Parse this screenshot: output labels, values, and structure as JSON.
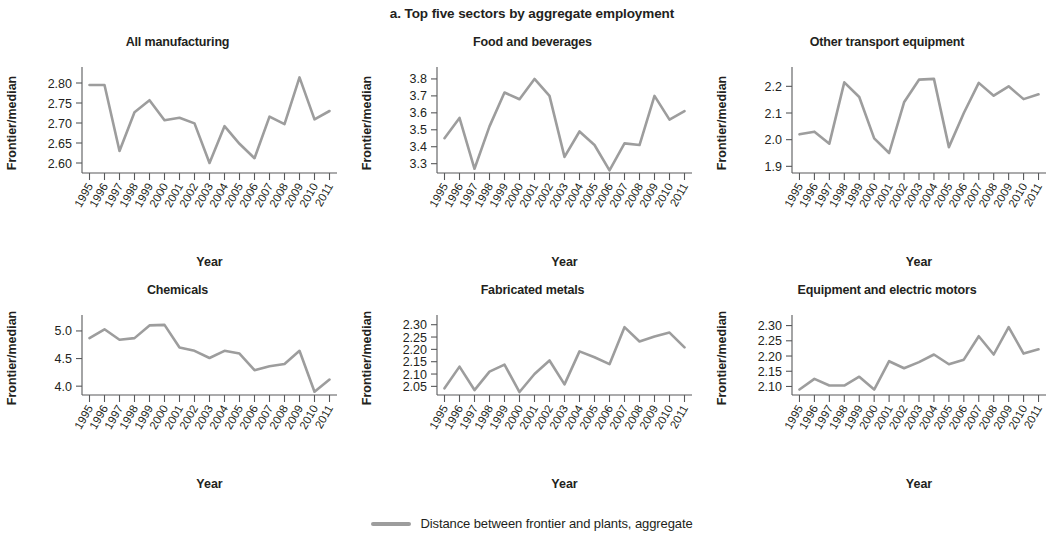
{
  "figure": {
    "title": "a. Top five sectors by aggregate employment",
    "axis_label_y": "Frontier/median",
    "axis_label_x": "Year",
    "legend_label": "Distance between frontier and plants, aggregate",
    "line_color": "#9d9d9d",
    "axis_color": "#58595b"
  },
  "chart_data": [
    {
      "type": "line",
      "title": "All manufacturing",
      "xlabel": "Year",
      "ylabel": "Frontier/median",
      "grid": false,
      "legend_position": "bottom-center",
      "series_name": "Distance between frontier and plants, aggregate",
      "categories": [
        "1995",
        "1996",
        "1997",
        "1998",
        "1999",
        "2000",
        "2001",
        "2002",
        "2003",
        "2004",
        "2005",
        "2006",
        "2007",
        "2008",
        "2009",
        "2010",
        "2011"
      ],
      "x": [
        1995,
        1996,
        1997,
        1998,
        1999,
        2000,
        2001,
        2002,
        2003,
        2004,
        2005,
        2006,
        2007,
        2008,
        2009,
        2010,
        2011
      ],
      "values": [
        2.795,
        2.795,
        2.63,
        2.727,
        2.757,
        2.707,
        2.713,
        2.699,
        2.6,
        2.692,
        2.648,
        2.612,
        2.716,
        2.697,
        2.814,
        2.709,
        2.73
      ],
      "ylim": [
        2.575,
        2.825
      ],
      "yticks": [
        2.6,
        2.65,
        2.7,
        2.75,
        2.8
      ],
      "ytick_labels": [
        "2.60",
        "2.65",
        "2.70",
        "2.75",
        "2.80"
      ]
    },
    {
      "type": "line",
      "title": "Food and beverages",
      "xlabel": "Year",
      "ylabel": "Frontier/median",
      "grid": false,
      "legend_position": "bottom-center",
      "series_name": "Distance between frontier and plants, aggregate",
      "categories": [
        "1995",
        "1996",
        "1997",
        "1998",
        "1999",
        "2000",
        "2001",
        "2002",
        "2003",
        "2004",
        "2005",
        "2006",
        "2007",
        "2008",
        "2009",
        "2010",
        "2011"
      ],
      "x": [
        1995,
        1996,
        1997,
        1998,
        1999,
        2000,
        2001,
        2002,
        2003,
        2004,
        2005,
        2006,
        2007,
        2008,
        2009,
        2010,
        2011
      ],
      "values": [
        3.45,
        3.57,
        3.27,
        3.52,
        3.72,
        3.68,
        3.8,
        3.7,
        3.34,
        3.49,
        3.41,
        3.26,
        3.42,
        3.41,
        3.7,
        3.56,
        3.61
      ],
      "ylim": [
        3.245,
        3.835
      ],
      "yticks": [
        3.3,
        3.4,
        3.5,
        3.6,
        3.7,
        3.8
      ],
      "ytick_labels": [
        "3.3",
        "3.4",
        "3.5",
        "3.6",
        "3.7",
        "3.8"
      ]
    },
    {
      "type": "line",
      "title": "Other transport equipment",
      "xlabel": "Year",
      "ylabel": "Frontier/median",
      "grid": false,
      "legend_position": "bottom-center",
      "series_name": "Distance between frontier and plants, aggregate",
      "categories": [
        "1995",
        "1996",
        "1997",
        "1998",
        "1999",
        "2000",
        "2001",
        "2002",
        "2003",
        "2004",
        "2005",
        "2006",
        "2007",
        "2008",
        "2009",
        "2010",
        "2011"
      ],
      "x": [
        1995,
        1996,
        1997,
        1998,
        1999,
        2000,
        2001,
        2002,
        2003,
        2004,
        2005,
        2006,
        2007,
        2008,
        2009,
        2010,
        2011
      ],
      "values": [
        2.02,
        2.03,
        1.985,
        2.215,
        2.16,
        2.005,
        1.95,
        2.14,
        2.225,
        2.228,
        1.972,
        2.1,
        2.213,
        2.165,
        2.2,
        2.152,
        2.17
      ],
      "ylim": [
        1.875,
        2.25
      ],
      "yticks": [
        1.9,
        2.0,
        2.1,
        2.2
      ],
      "ytick_labels": [
        "1.9",
        "2.0",
        "2.1",
        "2.2"
      ]
    },
    {
      "type": "line",
      "title": "Chemicals",
      "xlabel": "Year",
      "ylabel": "Frontier/median",
      "grid": false,
      "legend_position": "bottom-center",
      "series_name": "Distance between frontier and plants, aggregate",
      "categories": [
        "1995",
        "1996",
        "1997",
        "1998",
        "1999",
        "2000",
        "2001",
        "2002",
        "2003",
        "2004",
        "2005",
        "2006",
        "2007",
        "2008",
        "2009",
        "2010",
        "2011"
      ],
      "x": [
        1995,
        1996,
        1997,
        1998,
        1999,
        2000,
        2001,
        2002,
        2003,
        2004,
        2005,
        2006,
        2007,
        2008,
        2009,
        2010,
        2011
      ],
      "values": [
        4.87,
        5.03,
        4.84,
        4.87,
        5.1,
        5.11,
        4.7,
        4.64,
        4.51,
        4.64,
        4.59,
        4.29,
        4.36,
        4.4,
        4.64,
        3.9,
        4.12
      ],
      "ylim": [
        3.84,
        5.18
      ],
      "yticks": [
        4.0,
        4.5,
        5.0
      ],
      "ytick_labels": [
        "4.0",
        "4.5",
        "5.0"
      ]
    },
    {
      "type": "line",
      "title": "Fabricated metals",
      "xlabel": "Year",
      "ylabel": "Frontier/median",
      "grid": false,
      "legend_position": "bottom-center",
      "series_name": "Distance between frontier and plants, aggregate",
      "categories": [
        "1995",
        "1996",
        "1997",
        "1998",
        "1999",
        "2000",
        "2001",
        "2002",
        "2003",
        "2004",
        "2005",
        "2006",
        "2007",
        "2008",
        "2009",
        "2010",
        "2011"
      ],
      "x": [
        1995,
        1996,
        1997,
        1998,
        1999,
        2000,
        2001,
        2002,
        2003,
        2004,
        2005,
        2006,
        2007,
        2008,
        2009,
        2010,
        2011
      ],
      "values": [
        2.042,
        2.13,
        2.035,
        2.11,
        2.138,
        2.027,
        2.1,
        2.155,
        2.058,
        2.192,
        2.168,
        2.14,
        2.29,
        2.232,
        2.252,
        2.268,
        2.208
      ],
      "ylim": [
        2.015,
        2.315
      ],
      "yticks": [
        2.05,
        2.1,
        2.15,
        2.2,
        2.25,
        2.3
      ],
      "ytick_labels": [
        "2.05",
        "2.10",
        "2.15",
        "2.20",
        "2.25",
        "2.30"
      ]
    },
    {
      "type": "line",
      "title": "Equipment and electric motors",
      "xlabel": "Year",
      "ylabel": "Frontier/median",
      "grid": false,
      "legend_position": "bottom-center",
      "series_name": "Distance between frontier and plants, aggregate",
      "categories": [
        "1995",
        "1996",
        "1997",
        "1998",
        "1999",
        "2000",
        "2001",
        "2002",
        "2003",
        "2004",
        "2005",
        "2006",
        "2007",
        "2008",
        "2009",
        "2010",
        "2011"
      ],
      "x": [
        1995,
        1996,
        1997,
        1998,
        1999,
        2000,
        2001,
        2002,
        2003,
        2004,
        2005,
        2006,
        2007,
        2008,
        2009,
        2010,
        2011
      ],
      "values": [
        2.09,
        2.125,
        2.103,
        2.103,
        2.132,
        2.09,
        2.183,
        2.16,
        2.18,
        2.205,
        2.173,
        2.188,
        2.265,
        2.205,
        2.295,
        2.208,
        2.222
      ],
      "ylim": [
        2.072,
        2.315
      ],
      "yticks": [
        2.1,
        2.15,
        2.2,
        2.25,
        2.3
      ],
      "ytick_labels": [
        "2.10",
        "2.15",
        "2.20",
        "2.25",
        "2.30"
      ]
    }
  ]
}
